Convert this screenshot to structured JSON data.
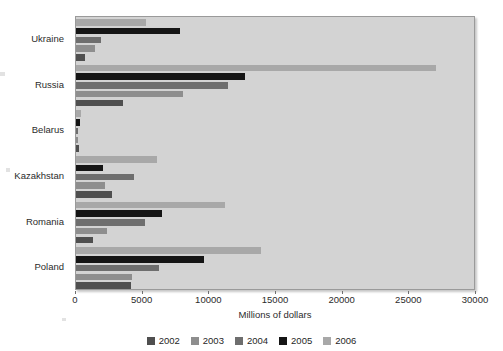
{
  "chart_data": {
    "type": "bar",
    "orientation": "horizontal",
    "title": "",
    "subtitle": "",
    "xlabel": "Millions of dollars",
    "ylabel": "",
    "xlim": [
      0,
      30000
    ],
    "xticks": [
      0,
      5000,
      10000,
      15000,
      20000,
      25000,
      30000
    ],
    "xtick_labels": [
      "0",
      "5000",
      "10000",
      "15000",
      "20000",
      "25000",
      "30000"
    ],
    "grid": false,
    "legend_position": "bottom",
    "categories": [
      "Ukraine",
      "Russia",
      "Belarus",
      "Kazakhstan",
      "Romania",
      "Poland"
    ],
    "series": [
      {
        "name": "2002",
        "color": "#4f4f4f",
        "values": [
          640,
          3560,
          250,
          2700,
          1310,
          4130
        ]
      },
      {
        "name": "2003",
        "color": "#8e8e8e",
        "values": [
          1430,
          8000,
          170,
          2210,
          2310,
          4210
        ]
      },
      {
        "name": "2004",
        "color": "#6e6e6e",
        "values": [
          1870,
          11400,
          170,
          4330,
          5180,
          6240
        ]
      },
      {
        "name": "2005",
        "color": "#151515",
        "values": [
          7810,
          12700,
          300,
          2010,
          6480,
          9580
        ]
      },
      {
        "name": "2006",
        "color": "#a8a8a8",
        "values": [
          5240,
          27000,
          360,
          6110,
          11200,
          13900
        ]
      }
    ],
    "bar_order_top_to_bottom": [
      "2006",
      "2005",
      "2004",
      "2003",
      "2002"
    ]
  },
  "legend": {
    "items": [
      {
        "label": "2002",
        "color": "#4f4f4f"
      },
      {
        "label": "2003",
        "color": "#8e8e8e"
      },
      {
        "label": "2004",
        "color": "#6e6e6e"
      },
      {
        "label": "2005",
        "color": "#151515"
      },
      {
        "label": "2006",
        "color": "#a8a8a8"
      }
    ]
  },
  "style": {
    "plot_background": "#d3d3d3",
    "page_background": "#ffffff",
    "axis_text": "#2b2b2b",
    "frame": "#9a9a9a"
  }
}
